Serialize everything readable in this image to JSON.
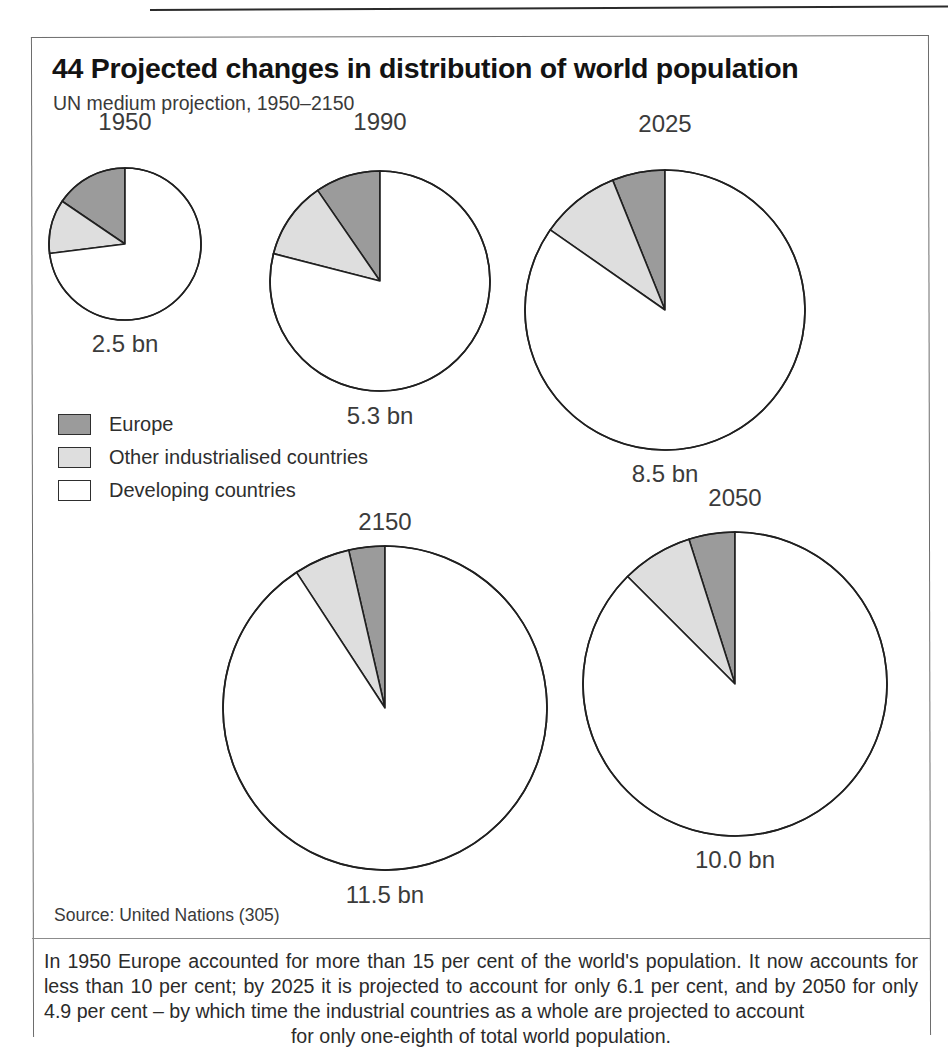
{
  "figure": {
    "number": "44",
    "title": "44 Projected changes in distribution of world population",
    "subtitle": "UN medium projection, 1950–2150",
    "source": "Source: United Nations (305)",
    "caption": "In 1950 Europe accounted for more than 15 per cent of the world's population. It now accounts for less than 10 per cent; by 2025 it is projected to account for only 6.1 per cent, and by 2050 for only 4.9 per cent – by which time the industrial countries as a whole are projected to account",
    "caption_last_line": "for only one-eighth of total world population."
  },
  "legend": {
    "items": [
      {
        "label": "Europe",
        "color": "#9b9b9b"
      },
      {
        "label": "Other industrialised countries",
        "color": "#dedede"
      },
      {
        "label": "Developing countries",
        "color": "#ffffff"
      }
    ]
  },
  "colors": {
    "europe": "#9b9b9b",
    "other_industrialised": "#dedede",
    "developing": "#ffffff",
    "outline": "#202020",
    "frame": "#6d6d6d"
  },
  "chart_data": {
    "type": "pie",
    "title": "44 Projected changes in distribution of world population",
    "subtitle": "UN medium projection, 1950–2150",
    "legend_position": "left-middle",
    "categories": [
      "Europe",
      "Other industrialised countries",
      "Developing countries"
    ],
    "value_unit": "per cent of world population",
    "size_unit": "bn (billion people)",
    "note": "Pie radii scale with total world population; slices start at 12 o'clock and run counter-clockwise.",
    "pies": [
      {
        "year": "1950",
        "total_label": "2.5 bn",
        "total_bn": 2.5,
        "values": [
          15.5,
          11.5,
          73.0
        ],
        "radius_px": 76
      },
      {
        "year": "1990",
        "total_label": "5.3 bn",
        "total_bn": 5.3,
        "values": [
          9.6,
          11.4,
          79.0
        ],
        "radius_px": 110
      },
      {
        "year": "2025",
        "total_label": "8.5 bn",
        "total_bn": 8.5,
        "values": [
          6.1,
          9.2,
          84.7
        ],
        "radius_px": 140
      },
      {
        "year": "2150",
        "total_label": "11.5 bn",
        "total_bn": 11.5,
        "values": [
          3.6,
          5.6,
          90.8
        ],
        "radius_px": 162
      },
      {
        "year": "2050",
        "total_label": "10.0 bn",
        "total_bn": 10.0,
        "values": [
          4.9,
          7.6,
          87.5
        ],
        "radius_px": 152
      }
    ]
  },
  "layout": {
    "pie_positions": [
      {
        "year": "1950",
        "cx": 93,
        "cy": 208,
        "label_top": 72,
        "total_top": 294
      },
      {
        "year": "1990",
        "cx": 348,
        "cy": 245,
        "label_top": 72,
        "total_top": 366
      },
      {
        "year": "2025",
        "cx": 633,
        "cy": 274,
        "label_top": 74,
        "total_top": 424
      },
      {
        "year": "2150",
        "cx": 353,
        "cy": 672,
        "label_top": 472,
        "total_top": 845
      },
      {
        "year": "2050",
        "cx": 703,
        "cy": 648,
        "label_top": 448,
        "total_top": 810
      }
    ]
  }
}
